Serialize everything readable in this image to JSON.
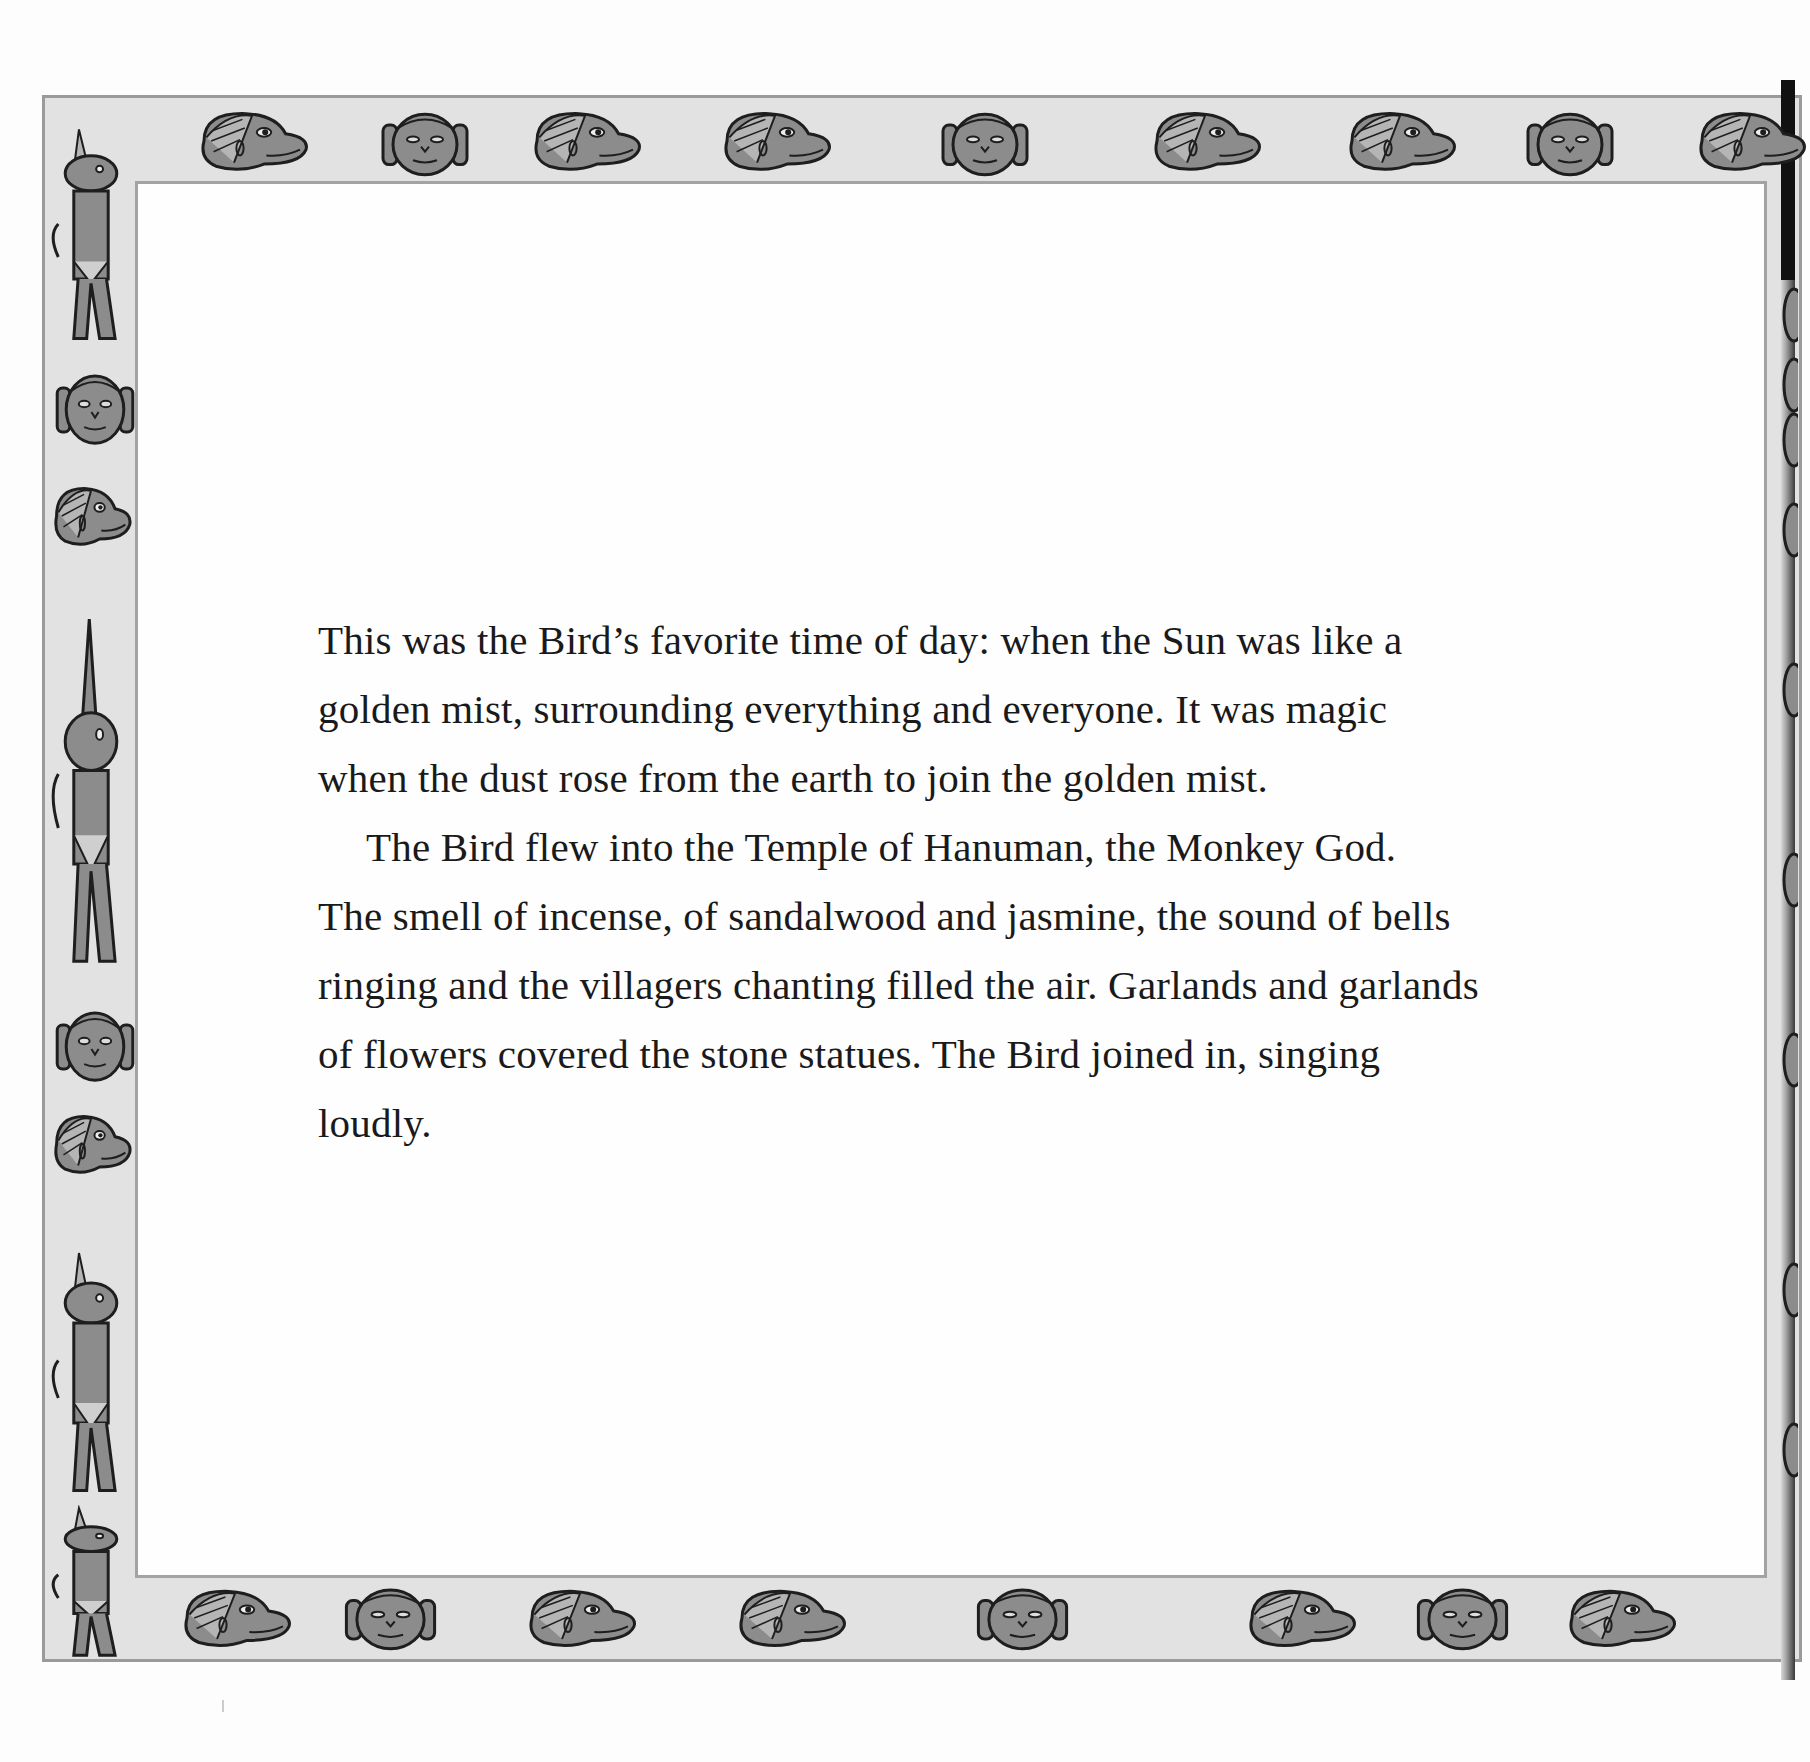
{
  "page": {
    "colors": {
      "background": "#fdfdfd",
      "frame_fill": "#e2e2e2",
      "frame_line": "#9a9a9a",
      "figure_fill": "#8c8c8c",
      "figure_outline": "#1e1e1e",
      "text": "#1a1a1a"
    },
    "border": {
      "top_figures": [
        "monkey-head-profile",
        "monkey-face-front",
        "monkey-head-profile",
        "monkey-head-profile",
        "monkey-face-front",
        "monkey-head-profile",
        "monkey-head-profile",
        "monkey-face-front",
        "monkey-head-profile"
      ],
      "bottom_figures": [
        "monkey-head-profile",
        "monkey-face-front",
        "monkey-head-profile",
        "monkey-head-profile",
        "monkey-face-front",
        "monkey-head-profile",
        "monkey-face-front",
        "monkey-head-profile"
      ],
      "left_figures": [
        "monkey-standing-praying",
        "monkey-face-front",
        "monkey-head-profile",
        "monkey-arms-raised",
        "monkey-face-front",
        "monkey-head-profile",
        "monkey-standing",
        "monkey-kneeling"
      ]
    },
    "story": {
      "paragraphs": [
        "This was the Bird’s favorite time of day: when the Sun was like a golden mist, surrounding everything and everyone. It was magic when the dust rose from the earth to join the golden mist.",
        "The Bird flew into the Temple of Hanuman, the Monkey God. The smell of incense, of sandalwood and jasmine, the sound of bells ringing and the villagers chanting filled the air. Garlands and garlands of flowers covered the stone statues. The Bird joined in, singing loudly."
      ],
      "lines": [
        "This was the Bird’s favorite time of day: when the Sun was like a",
        "golden mist, surrounding everything and everyone. It was magic",
        "when the dust rose from the earth to join the golden mist.",
        "The Bird flew into the Temple of Hanuman, the Monkey God.",
        "The smell of incense, of sandalwood and jasmine, the sound of bells",
        "ringing and the villagers chanting filled the air. Garlands and garlands",
        "of flowers covered the stone statues. The Bird joined in, singing",
        "loudly."
      ]
    }
  }
}
